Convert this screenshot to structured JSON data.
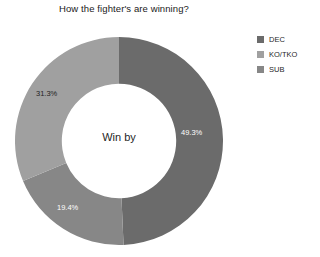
{
  "chart_data": {
    "type": "pie",
    "variant": "donut",
    "title": "How the fighter's are winning?",
    "center_label": "Win by",
    "xlabel": "",
    "ylabel": "",
    "grid": false,
    "legend_position": "right",
    "start_angle_deg": 0,
    "direction": "clockwise",
    "hole_ratio": 0.55,
    "categories": [
      "DEC",
      "KO/TKO",
      "SUB"
    ],
    "values": [
      49.3,
      19.4,
      31.3
    ],
    "slices": [
      {
        "label": "DEC",
        "value": 49.3,
        "display": "49.3%",
        "color": "#6b6b6b",
        "label_color": "#ffffff"
      },
      {
        "label": "SUB",
        "value": 19.4,
        "display": "19.4%",
        "color": "#878787",
        "label_color": "#ffffff"
      },
      {
        "label": "KO/TKO",
        "value": 31.3,
        "display": "31.3%",
        "color": "#a0a0a0",
        "label_color": "#1f1f1f"
      }
    ]
  },
  "legend": {
    "items": [
      {
        "label": "DEC",
        "color": "#6b6b6b"
      },
      {
        "label": "KO/TKO",
        "color": "#a0a0a0"
      },
      {
        "label": "SUB",
        "color": "#878787"
      }
    ]
  }
}
